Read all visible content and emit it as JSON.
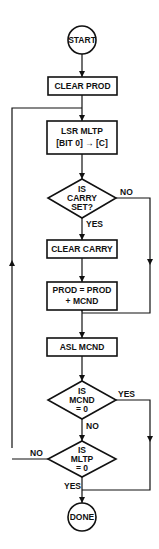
{
  "flowchart": {
    "start": "START",
    "clear_prod": "CLEAR PROD",
    "lsr": {
      "line1": "LSR MLTP",
      "line2": "[BIT 0] → [C]"
    },
    "carry_decision": {
      "line1": "IS",
      "line2": "CARRY",
      "line3": "SET?"
    },
    "carry_yes": "YES",
    "carry_no": "NO",
    "clear_carry": "CLEAR CARRY",
    "add": {
      "line1": "PROD = PROD",
      "line2": "+ MCND"
    },
    "asl": "ASL MCND",
    "mcnd_decision": {
      "line1": "IS",
      "line2": "MCND",
      "line3": "= 0"
    },
    "mcnd_yes": "YES",
    "mcnd_no": "NO",
    "mltp_decision": {
      "line1": "IS",
      "line2": "MLTP",
      "line3": "= 0"
    },
    "mltp_yes": "YES",
    "mltp_no": "NO",
    "done": "DONE"
  }
}
